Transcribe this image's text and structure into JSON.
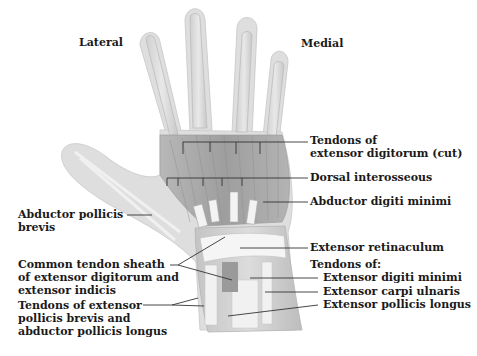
{
  "diagram": {
    "orientation": {
      "lateral": "Lateral",
      "medial": "Medial"
    },
    "labels": {
      "tendons_ext_dig_1": "Tendons of",
      "tendons_ext_dig_2": "extensor digitorum (cut)",
      "dorsal_interosseous": "Dorsal interosseous",
      "abductor_digiti_minimi": "Abductor digiti minimi",
      "extensor_retinaculum": "Extensor retinaculum",
      "tendons_of": "Tendons of:",
      "ext_digiti_minimi": "Extensor digiti minimi",
      "ext_carpi_ulnaris": "Extensor carpi ulnaris",
      "ext_pollicis_longus": "Extensor pollicis longus",
      "abductor_pollicis_1": "Abductor pollicis",
      "abductor_pollicis_2": "brevis",
      "common_sheath_1": "Common tendon sheath",
      "common_sheath_2": "of extensor digitorum and",
      "common_sheath_3": "extensor indicis",
      "tendons_epb_1": "Tendons of extensor",
      "tendons_epb_2": "pollicis brevis and",
      "tendons_epb_3": "abductor pollicis longus"
    },
    "colors": {
      "skin_outline": "#d4d4d4",
      "muscle": "#a9a9a9",
      "tendon": "#eeeeee",
      "leader_line": "#333333",
      "text": "#1a1a1a"
    }
  }
}
